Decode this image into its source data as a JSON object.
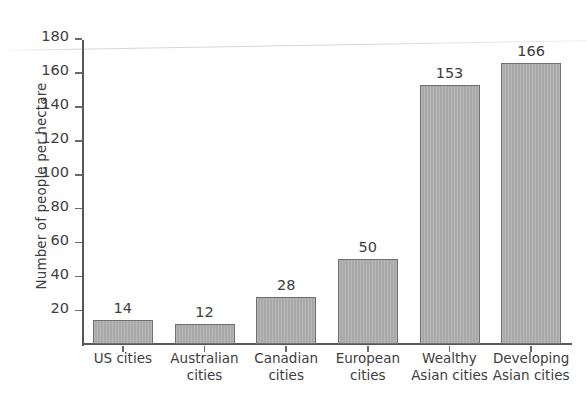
{
  "chart_data": {
    "type": "bar",
    "title": "",
    "xlabel": "",
    "ylabel": "Number of people per hectare",
    "categories": [
      "US cities",
      "Australian cities",
      "Canadian cities",
      "European cities",
      "Wealthy Asian cities",
      "Developing Asian cities"
    ],
    "category_lines": [
      [
        "US cities",
        ""
      ],
      [
        "Australian",
        "cities"
      ],
      [
        "Canadian",
        "cities"
      ],
      [
        "European",
        "cities"
      ],
      [
        "Wealthy",
        "Asian cities"
      ],
      [
        "Developing",
        "Asian cities"
      ]
    ],
    "values": [
      14,
      12,
      28,
      50,
      153,
      166
    ],
    "value_labels": [
      "14",
      "12",
      "28",
      "50",
      "153",
      "166"
    ],
    "ylim": [
      0,
      180
    ],
    "yticks": [
      20,
      40,
      60,
      80,
      100,
      120,
      140,
      160,
      180
    ],
    "ytick_labels": [
      "20",
      "40",
      "60",
      "80",
      "100",
      "120",
      "140",
      "160",
      "180"
    ],
    "grid": false,
    "legend": null,
    "bar_color": "#a9a9a9",
    "bar_border_color": "#6f6f71",
    "axis_color": "#58585a",
    "text_color": "#3d3d3d",
    "background": "#ffffff"
  }
}
